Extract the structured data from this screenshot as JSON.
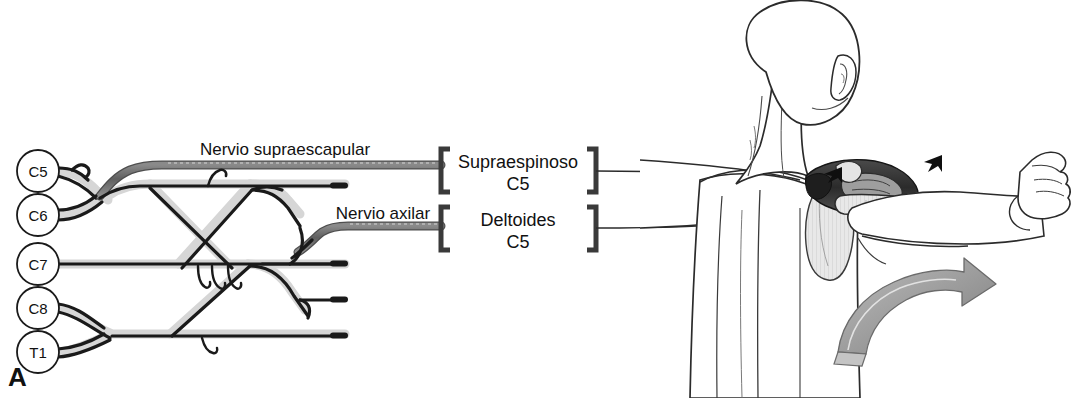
{
  "figure": {
    "panel_letter": "A",
    "background_color": "#ffffff",
    "ink_color": "#111111",
    "nerve_highlight_color": "#6e6e6e",
    "nerve_pale_color": "#d9d9d9",
    "arrow_fill_color": "#9a9a9a",
    "muscle_dark_color": "#2b2b2b"
  },
  "plexus": {
    "title_hidden": true,
    "roots": [
      {
        "label": "C5",
        "cx": 38,
        "cy": 171
      },
      {
        "label": "C6",
        "cx": 38,
        "cy": 215
      },
      {
        "label": "C7",
        "cx": 38,
        "cy": 264
      },
      {
        "label": "C8",
        "cx": 38,
        "cy": 308
      },
      {
        "label": "T1",
        "cx": 38,
        "cy": 352
      }
    ],
    "nerve_labels": [
      {
        "name": "nervio-supraescapular",
        "text": "Nervio supraescapular",
        "x": 285,
        "y": 155
      },
      {
        "name": "nervio-axilar",
        "text": "Nervio axilar",
        "x": 383,
        "y": 219
      }
    ]
  },
  "targets": [
    {
      "name": "supraespinoso",
      "muscle": "Supraespinoso",
      "root": "C5",
      "bracket_left_x": 441,
      "bracket_right_x": 596,
      "center_x": 518,
      "top_y": 149,
      "bottom_y": 192,
      "leader_y": 171
    },
    {
      "name": "deltoides",
      "muscle": "Deltoides",
      "root": "C5",
      "bracket_left_x": 441,
      "bracket_right_x": 596,
      "center_x": 518,
      "top_y": 207,
      "bottom_y": 250,
      "leader_y": 228
    }
  ],
  "anatomy": {
    "view": "posterior-shoulder-dissection",
    "description_hidden": true,
    "motion_arrow": "abduction-arrow",
    "contraction_arrows": 2
  }
}
